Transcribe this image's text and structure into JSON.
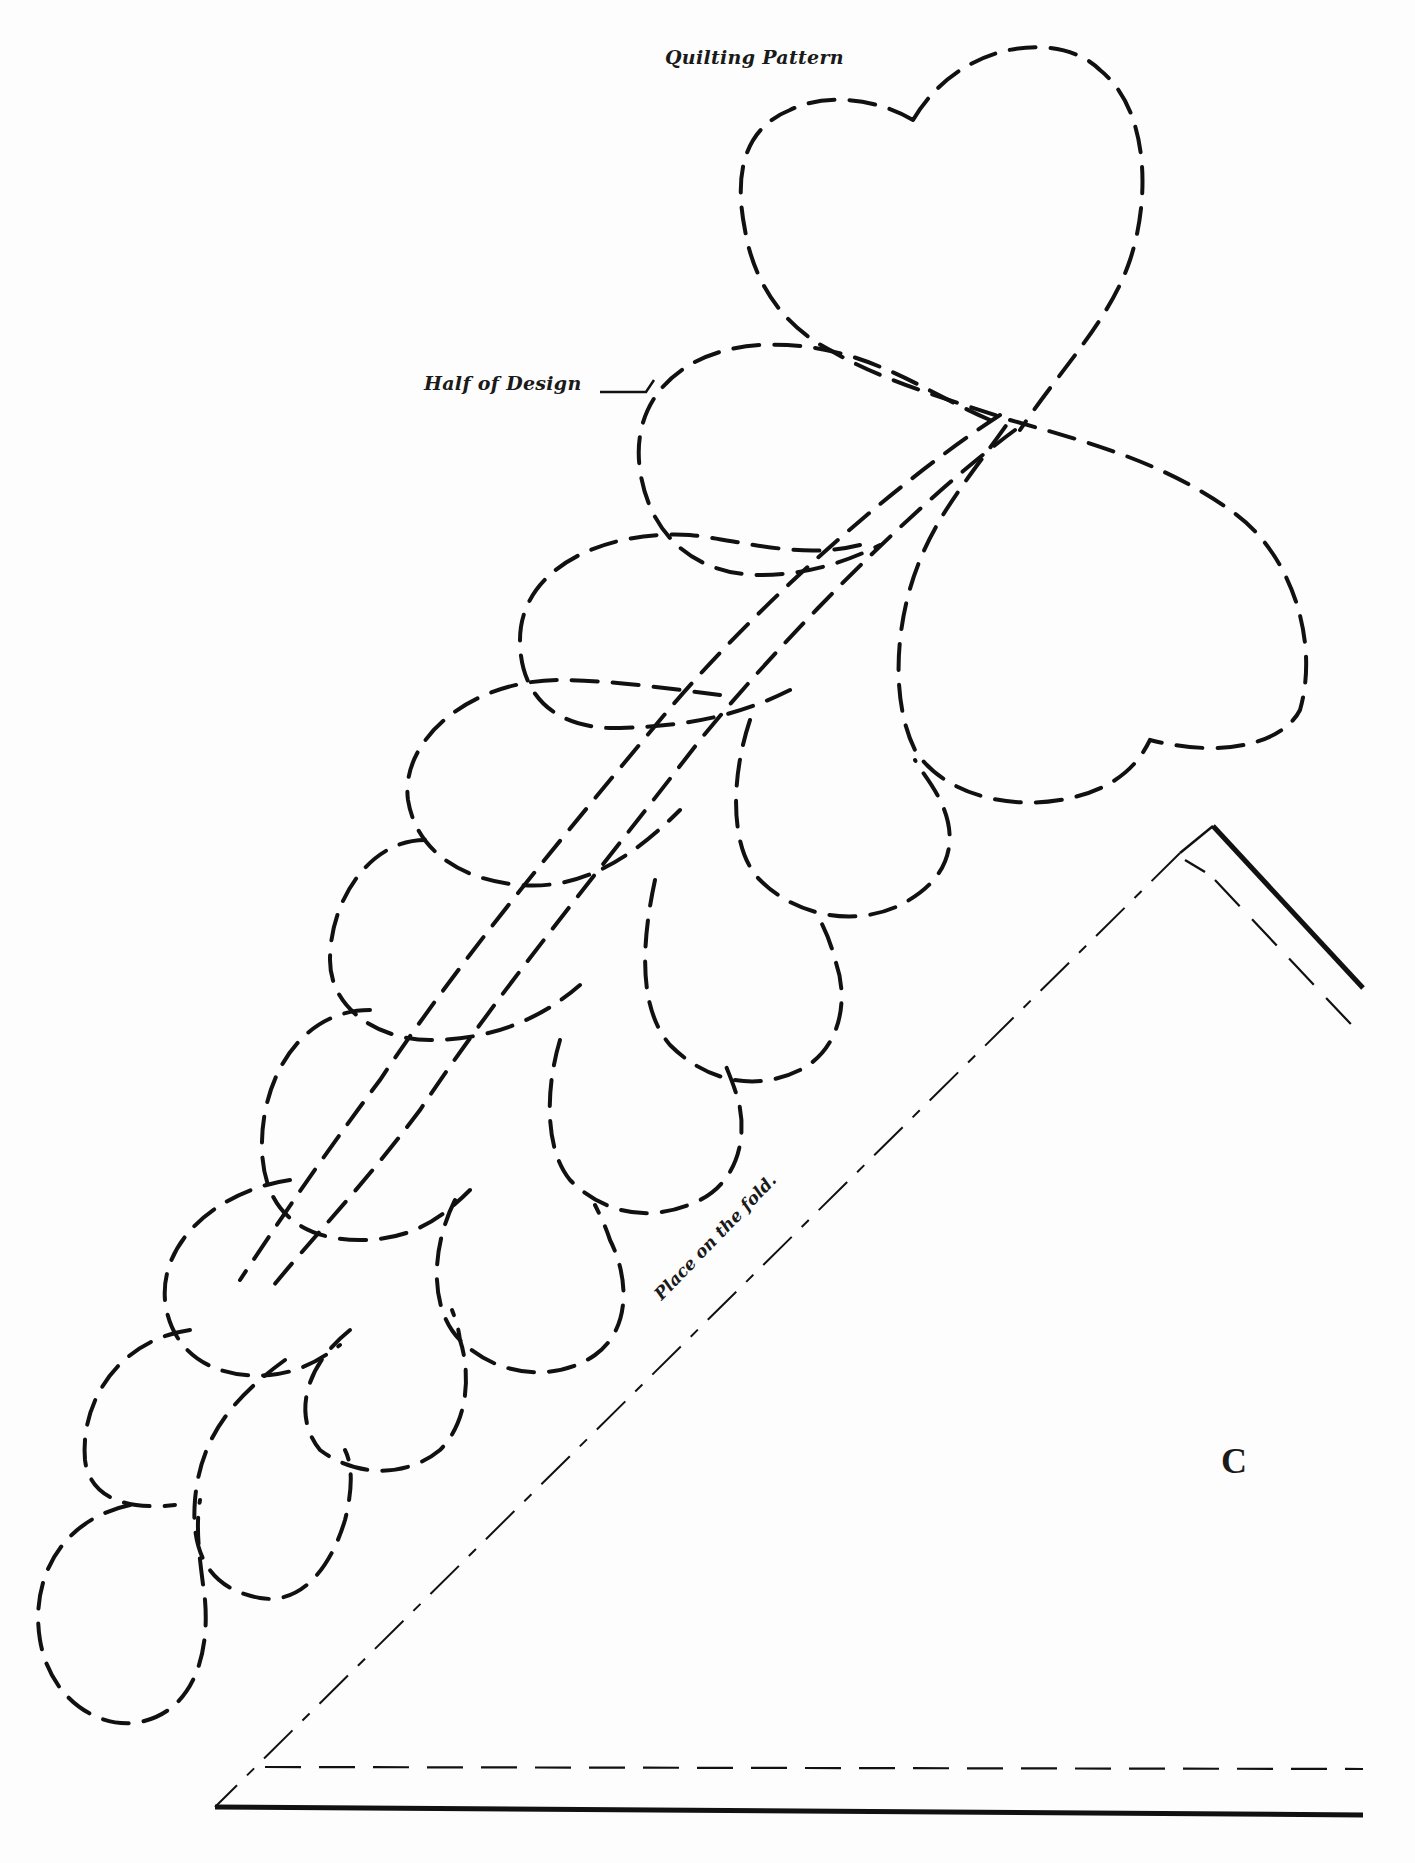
{
  "page": {
    "title": "Quilting Pattern",
    "design_label": "Half of Design",
    "fold_instruction": "Place on the fold.",
    "piece_letter": "C"
  },
  "pattern": {
    "motif": "feathered-plume-with-heart",
    "lines": {
      "quilting_line": "dashed",
      "fold_line": "dash-dot",
      "seam_line": "dashed",
      "cutting_line": "solid"
    },
    "colors": {
      "ink": "#111111",
      "paper": "#fdfdfd"
    }
  }
}
